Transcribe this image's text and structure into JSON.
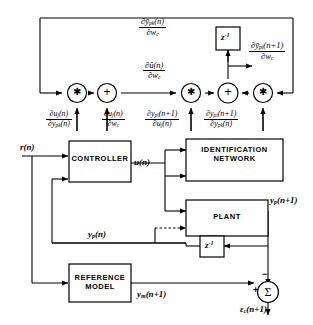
{
  "diagram": {
    "stroke_color": "#000000",
    "background_color": "#ffffff"
  },
  "blocks": {
    "controller": {
      "label": "CONTROLLER"
    },
    "identification_network": {
      "line1": "IDENTIFICATION",
      "line2": "NETWORK"
    },
    "plant": {
      "label": "PLANT"
    },
    "reference_model": {
      "line1": "REFERENCE",
      "line2": "MODEL"
    },
    "delay_top": {
      "label": "z",
      "exponent": "-1"
    },
    "delay_bottom": {
      "label": "z",
      "exponent": "-1"
    }
  },
  "operators": {
    "mult_left": {
      "glyph": "✱",
      "name": "multiply"
    },
    "sum_left": {
      "glyph": "+",
      "name": "add"
    },
    "mult_mid": {
      "glyph": "✱",
      "name": "multiply"
    },
    "sum_mid": {
      "glyph": "+",
      "name": "add"
    },
    "mult_right": {
      "glyph": "✱",
      "name": "multiply"
    },
    "summing_junction": {
      "glyph": "Σ",
      "plus": "+",
      "minus": "−"
    }
  },
  "signals": {
    "reference_input": "r(n)",
    "control_output": "u(n)",
    "plant_output_next": "y",
    "plant_output_next_sub": "p",
    "plant_output_next_arg": "(n+1)",
    "plant_output": "y",
    "plant_output_sub": "p",
    "plant_output_arg": "(n)",
    "model_output": "y",
    "model_output_sub": "m",
    "model_output_arg": "(n+1)",
    "error": "ε",
    "error_sub": "c",
    "error_arg": "(n+1)"
  },
  "derivatives": {
    "dypk_dwc": {
      "num_pre": "∂ȳ",
      "num_sub": "pk",
      "num_post": "(n)",
      "den_pre": "∂w",
      "den_sub": "c",
      "den_post": ""
    },
    "du_dwc": {
      "num_pre": "∂ū",
      "num_sub": "",
      "num_post": "(n)",
      "den_pre": "∂w",
      "den_sub": "c",
      "den_post": ""
    },
    "dypi_next_dwc": {
      "num_pre": "∂ȳ",
      "num_sub": "pi",
      "num_post": "(n+1)",
      "den_pre": "∂w",
      "den_sub": "c",
      "den_post": ""
    },
    "duj_dypk": {
      "num_pre": "∂u",
      "num_sub": "j",
      "num_post": "(n)",
      "den_pre": "∂y",
      "den_sub": "pk",
      "den_post": "(n)"
    },
    "duj_dwc": {
      "num_pre": "∂u",
      "num_sub": "j",
      "num_post": "(n)",
      "den_pre": "∂w",
      "den_sub": "c",
      "den_post": ""
    },
    "dypi_next_duj": {
      "num_pre": "∂y",
      "num_sub": "pi",
      "num_post": "(n+1)",
      "den_pre": "∂u",
      "den_sub": "j",
      "den_post": "(n)"
    },
    "dypi_next_dypk": {
      "num_pre": "∂y",
      "num_sub": "pi",
      "num_post": "(n+1)",
      "den_pre": "∂y",
      "den_sub": "pk",
      "den_post": "(n)"
    }
  }
}
